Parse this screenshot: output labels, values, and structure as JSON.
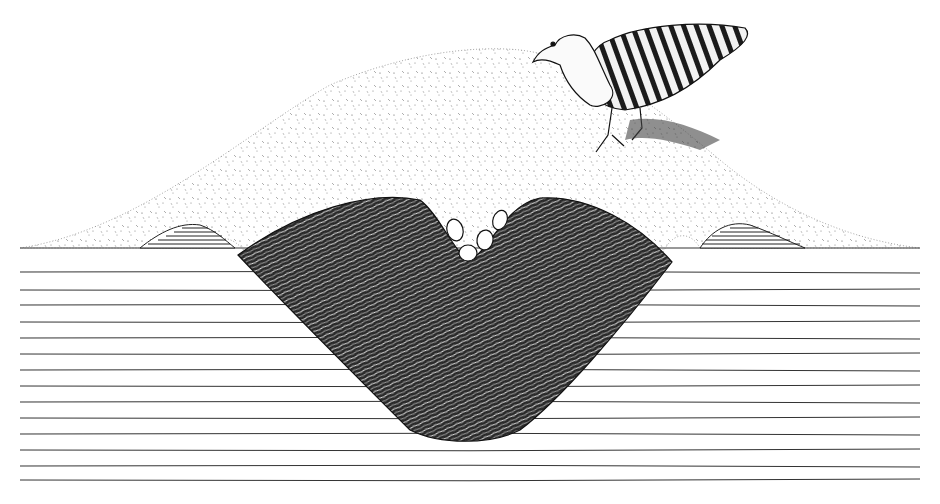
{
  "figure": {
    "subject": "Cross-section of a malleefowl nesting mound with bird standing on top",
    "elements": {
      "bird": "malleefowl",
      "mound": "sand mound",
      "egg_chamber": "decomposing organic litter core",
      "eggs": 4,
      "ground": "stratified soil layers"
    },
    "colors": {
      "ink": "#1a1a1a",
      "paper": "#ffffff",
      "sand_dot": "#555555"
    }
  }
}
